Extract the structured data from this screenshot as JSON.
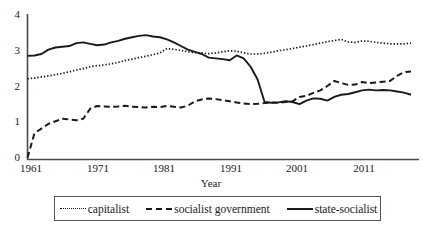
{
  "chart_data": {
    "type": "line",
    "title": "",
    "xlabel": "Year",
    "ylabel": "",
    "xlim": [
      1961,
      2016
    ],
    "ylim": [
      0,
      4
    ],
    "grid": false,
    "legend_position": "below-axes",
    "y_ticks": [
      "4",
      "3",
      "2",
      "1",
      "0"
    ],
    "x_ticks": [
      "1961",
      "1971",
      "1981",
      "1991",
      "2001",
      "2011"
    ],
    "x": [
      1961,
      1962,
      1963,
      1964,
      1965,
      1966,
      1967,
      1968,
      1969,
      1970,
      1971,
      1972,
      1973,
      1974,
      1975,
      1976,
      1977,
      1978,
      1979,
      1980,
      1981,
      1982,
      1983,
      1984,
      1985,
      1986,
      1987,
      1988,
      1989,
      1990,
      1991,
      1992,
      1993,
      1994,
      1995,
      1996,
      1997,
      1998,
      1999,
      2000,
      2001,
      2002,
      2003,
      2004,
      2005,
      2006,
      2007,
      2008,
      2009,
      2010,
      2011,
      2012,
      2013,
      2014,
      2015,
      2016
    ],
    "series": [
      {
        "name": "capitalist",
        "style": "dotted",
        "color": "#1a1a1a",
        "values": [
          2.22,
          2.24,
          2.27,
          2.3,
          2.33,
          2.37,
          2.41,
          2.46,
          2.5,
          2.55,
          2.58,
          2.6,
          2.63,
          2.67,
          2.72,
          2.76,
          2.8,
          2.84,
          2.88,
          2.93,
          3.05,
          3.03,
          3.0,
          2.96,
          2.94,
          2.93,
          2.91,
          2.93,
          2.96,
          2.99,
          2.98,
          2.93,
          2.9,
          2.9,
          2.92,
          2.95,
          2.99,
          3.02,
          3.05,
          3.09,
          3.12,
          3.16,
          3.2,
          3.24,
          3.27,
          3.3,
          3.23,
          3.22,
          3.26,
          3.25,
          3.22,
          3.2,
          3.18,
          3.18,
          3.18,
          3.2
        ]
      },
      {
        "name": "socialist government",
        "style": "dashed",
        "color": "#1a1a1a",
        "values": [
          0.05,
          0.72,
          0.85,
          0.98,
          1.05,
          1.12,
          1.1,
          1.08,
          1.12,
          1.4,
          1.47,
          1.46,
          1.45,
          1.46,
          1.48,
          1.45,
          1.44,
          1.43,
          1.45,
          1.44,
          1.47,
          1.45,
          1.43,
          1.48,
          1.6,
          1.65,
          1.68,
          1.66,
          1.63,
          1.6,
          1.57,
          1.54,
          1.52,
          1.53,
          1.55,
          1.57,
          1.56,
          1.58,
          1.6,
          1.72,
          1.75,
          1.83,
          1.9,
          2.02,
          2.16,
          2.1,
          2.05,
          2.06,
          2.13,
          2.1,
          2.12,
          2.14,
          2.16,
          2.3,
          2.4,
          2.42
        ]
      },
      {
        "name": "state-socialist",
        "style": "solid",
        "color": "#1a1a1a",
        "values": [
          2.85,
          2.86,
          2.9,
          3.02,
          3.08,
          3.1,
          3.12,
          3.2,
          3.22,
          3.18,
          3.14,
          3.16,
          3.22,
          3.26,
          3.32,
          3.36,
          3.4,
          3.42,
          3.38,
          3.36,
          3.3,
          3.22,
          3.12,
          3.02,
          2.96,
          2.9,
          2.8,
          2.78,
          2.76,
          2.73,
          2.86,
          2.78,
          2.55,
          2.2,
          1.58,
          1.56,
          1.57,
          1.6,
          1.58,
          1.52,
          1.62,
          1.68,
          1.67,
          1.62,
          1.72,
          1.78,
          1.8,
          1.85,
          1.9,
          1.92,
          1.9,
          1.91,
          1.9,
          1.87,
          1.84,
          1.78
        ]
      }
    ]
  },
  "axes": {
    "y_tick_values": [
      4,
      3,
      2,
      1,
      0
    ],
    "x_tick_values": [
      1961,
      1971,
      1981,
      1991,
      2001,
      2011
    ],
    "xlabel": "Year"
  },
  "legend": {
    "entries": [
      {
        "label": "capitalist",
        "style": "dotted"
      },
      {
        "label": "socialist government",
        "style": "dashed"
      },
      {
        "label": "state-socialist",
        "style": "solid"
      }
    ]
  }
}
